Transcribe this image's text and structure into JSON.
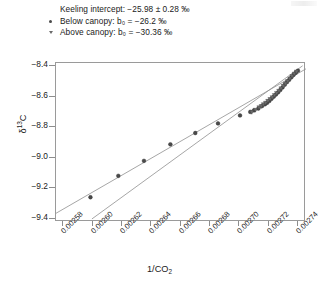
{
  "legend": {
    "rows": [
      {
        "marker": "none",
        "text": "Keeling intercept: −25.98 ± 0.28 ‰"
      },
      {
        "marker": "circle",
        "text": "Below canopy: b₀ = −26.2 ‰"
      },
      {
        "marker": "triangle",
        "text": "Above canopy: b₀ = −30.36 ‰"
      }
    ],
    "title_label": "Keeling intercept: −25.98 ± 0.28 ‰",
    "below_label": "Below canopy: b₀ = −26.2 ‰",
    "above_label": "Above canopy: b₀ = −30.36 ‰"
  },
  "axes": {
    "ylabel": "δ¹³C",
    "xlabel": "1/CO₂",
    "yticks": [
      "−8.4",
      "−8.6",
      "−8.8",
      "−9.0",
      "−9.2",
      "−9.4"
    ],
    "ytick_values": [
      -8.4,
      -8.6,
      -8.8,
      -9.0,
      -9.2,
      -9.4
    ],
    "xticks": [
      "0.00258",
      "0.00260",
      "0.00262",
      "0.00264",
      "0.00266",
      "0.00268",
      "0.00270",
      "0.00272",
      "0.00274"
    ],
    "xtick_values": [
      0.00258,
      0.0026,
      0.00262,
      0.00264,
      0.00266,
      0.00268,
      0.0027,
      0.00272,
      0.00274
    ]
  },
  "colors": {
    "frame": "#9a9a9a",
    "line": "#8f8f8f",
    "marker_below": "#4a4a4a",
    "marker_above": "#6a6a6a",
    "background": "#ffffff"
  },
  "chart_data": {
    "type": "scatter",
    "title": "",
    "xlabel": "1/CO2",
    "ylabel": "d13C",
    "xlim": [
      0.002575,
      0.0027455
    ],
    "ylim": [
      -9.42,
      -8.38
    ],
    "grid": false,
    "legend_position": "above-plot",
    "annotations": [
      "Keeling intercept: −25.98 ± 0.28 ‰",
      "Below canopy: b₀ = −26.2 ‰",
      "Above canopy: b₀ = −30.36 ‰"
    ],
    "series": [
      {
        "name": "Below canopy",
        "marker": "circle",
        "intercept_b0": -26.2,
        "points": [
          [
            0.0025985,
            -9.258
          ],
          [
            0.0026175,
            -9.118
          ],
          [
            0.002635,
            -9.02
          ],
          [
            0.002653,
            -8.912
          ],
          [
            0.00267,
            -8.838
          ],
          [
            0.0026855,
            -8.775
          ],
          [
            0.0027005,
            -8.723
          ],
          [
            0.0027075,
            -8.7
          ],
          [
            0.00271,
            -8.69
          ],
          [
            0.002713,
            -8.678
          ],
          [
            0.0027155,
            -8.662
          ],
          [
            0.0027175,
            -8.65
          ],
          [
            0.002719,
            -8.64
          ],
          [
            0.0027205,
            -8.628
          ],
          [
            0.002722,
            -8.614
          ],
          [
            0.0027235,
            -8.6
          ],
          [
            0.002725,
            -8.586
          ],
          [
            0.0027265,
            -8.572
          ],
          [
            0.002728,
            -8.556
          ],
          [
            0.0027295,
            -8.54
          ],
          [
            0.002731,
            -8.522
          ],
          [
            0.0027325,
            -8.505
          ],
          [
            0.002734,
            -8.49
          ],
          [
            0.0027355,
            -8.474
          ],
          [
            0.002737,
            -8.458
          ],
          [
            0.0027385,
            -8.444
          ],
          [
            0.00274,
            -8.43
          ]
        ]
      },
      {
        "name": "Above canopy",
        "marker": "triangle",
        "intercept_b0": -30.36,
        "points": [
          [
            0.0027085,
            -8.702
          ],
          [
            0.002711,
            -8.688
          ],
          [
            0.0027135,
            -8.672
          ],
          [
            0.002715,
            -8.664
          ],
          [
            0.0027165,
            -8.652
          ],
          [
            0.002718,
            -8.642
          ],
          [
            0.0027195,
            -8.63
          ],
          [
            0.002721,
            -8.618
          ],
          [
            0.0027225,
            -8.606
          ],
          [
            0.002724,
            -8.592
          ],
          [
            0.0027255,
            -8.578
          ],
          [
            0.002727,
            -8.564
          ],
          [
            0.0027285,
            -8.548
          ],
          [
            0.00273,
            -8.532
          ],
          [
            0.0027315,
            -8.516
          ],
          [
            0.002733,
            -8.5
          ],
          [
            0.0027345,
            -8.484
          ],
          [
            0.002736,
            -8.468
          ],
          [
            0.0027375,
            -8.452
          ],
          [
            0.002739,
            -8.438
          ]
        ]
      }
    ],
    "fit_lines": [
      {
        "name": "Below canopy fit",
        "x": [
          0.002575,
          0.0027455
        ],
        "y": [
          -9.363,
          -8.418
        ]
      },
      {
        "name": "Above canopy fit",
        "x": [
          0.0025995,
          0.0027432
        ],
        "y": [
          -9.4,
          -8.398
        ]
      }
    ]
  }
}
